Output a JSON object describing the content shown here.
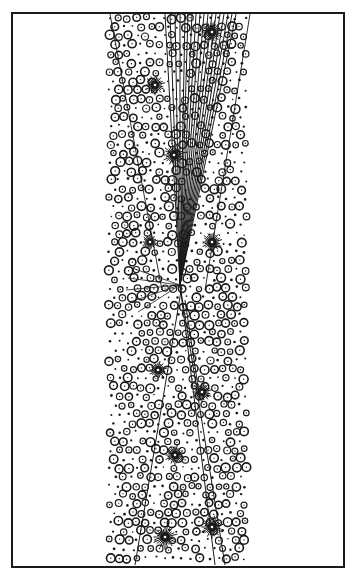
{
  "canvas": {
    "width": 355,
    "height": 577,
    "background": "#ffffff",
    "ink": "#1a1a1a"
  },
  "frame": {
    "x": 12,
    "y": 13,
    "width": 332,
    "height": 554,
    "stroke_width": 2
  },
  "band": {
    "top_left": 107,
    "top_right": 250,
    "bottom_left": 107,
    "bottom_right": 248,
    "wedge_lines": [
      {
        "x1": 110,
        "y1": 14,
        "x2": 162,
        "y2": 290
      },
      {
        "x1": 250,
        "y1": 14,
        "x2": 205,
        "y2": 290
      }
    ]
  },
  "stars": [
    {
      "x": 212,
      "y": 32,
      "r": 10
    },
    {
      "x": 155,
      "y": 85,
      "r": 9
    },
    {
      "x": 174,
      "y": 155,
      "r": 10
    },
    {
      "x": 150,
      "y": 242,
      "r": 7
    },
    {
      "x": 212,
      "y": 242,
      "r": 9
    },
    {
      "x": 158,
      "y": 370,
      "r": 8
    },
    {
      "x": 202,
      "y": 392,
      "r": 9
    },
    {
      "x": 175,
      "y": 455,
      "r": 9
    },
    {
      "x": 165,
      "y": 537,
      "r": 11
    },
    {
      "x": 212,
      "y": 527,
      "r": 10
    }
  ],
  "vertex": {
    "x": 180,
    "y": 285
  },
  "tracks_up": [
    165,
    170,
    175,
    180,
    185,
    188,
    192,
    196,
    200,
    204,
    208,
    212,
    216,
    220,
    224,
    228,
    232,
    236
  ],
  "tracks_left": [
    {
      "x": 132,
      "y": 268
    },
    {
      "x": 128,
      "y": 278
    },
    {
      "x": 126,
      "y": 290
    },
    {
      "x": 130,
      "y": 302
    },
    {
      "x": 138,
      "y": 312
    }
  ],
  "tracks_down": [
    {
      "x1": 180,
      "y1": 285,
      "x2": 215,
      "y2": 565
    },
    {
      "x1": 180,
      "y1": 285,
      "x2": 225,
      "y2": 565
    },
    {
      "x1": 182,
      "y1": 285,
      "x2": 135,
      "y2": 565
    },
    {
      "x1": 185,
      "y1": 300,
      "x2": 200,
      "y2": 400
    }
  ],
  "bubbles": {
    "seed": 7,
    "spacing": 9,
    "min_r": 1.5,
    "max_r": 4.5
  }
}
